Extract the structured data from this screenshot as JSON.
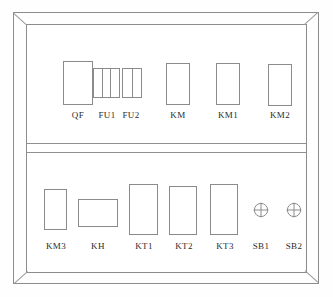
{
  "diagram": {
    "frame": {
      "style": "beveled-cabinet",
      "line_color": "#8b8b8b",
      "background_color": "#ffffff"
    },
    "shelves": [
      {
        "name": "upper-shelf",
        "components": [
          {
            "id": "QF",
            "label": "QF",
            "type": "circuit-breaker",
            "shape": "rectangle",
            "x": 63,
            "y": 61,
            "w": 30,
            "h": 44,
            "label_x": 48,
            "label_y": 110
          },
          {
            "id": "FU1",
            "label": "FU1",
            "type": "fuse-block",
            "shape": "segmented",
            "cells": 3,
            "x": 93,
            "y": 68,
            "w": 27,
            "h": 30,
            "label_x": 77,
            "label_y": 110
          },
          {
            "id": "FU2",
            "label": "FU2",
            "type": "fuse-block",
            "shape": "segmented",
            "cells": 2,
            "x": 122,
            "y": 68,
            "w": 20,
            "h": 30,
            "label_x": 101,
            "label_y": 110
          },
          {
            "id": "KM",
            "label": "KM",
            "type": "contactor",
            "shape": "rectangle",
            "x": 166,
            "y": 63,
            "w": 24,
            "h": 42,
            "label_x": 148,
            "label_y": 110
          },
          {
            "id": "KM1",
            "label": "KM1",
            "type": "contactor",
            "shape": "rectangle",
            "x": 216,
            "y": 63,
            "w": 24,
            "h": 42,
            "label_x": 198,
            "label_y": 110
          },
          {
            "id": "KM2",
            "label": "KM2",
            "type": "contactor",
            "shape": "rectangle",
            "x": 268,
            "y": 64,
            "w": 24,
            "h": 42,
            "label_x": 250,
            "label_y": 110
          }
        ]
      },
      {
        "name": "lower-shelf",
        "components": [
          {
            "id": "KM3",
            "label": "KM3",
            "type": "contactor",
            "shape": "rectangle",
            "x": 44,
            "y": 189,
            "w": 23,
            "h": 41,
            "label_x": 26,
            "label_y": 241
          },
          {
            "id": "KH",
            "label": "KH",
            "type": "thermal-relay",
            "shape": "rectangle",
            "x": 78,
            "y": 199,
            "w": 40,
            "h": 28,
            "label_x": 68,
            "label_y": 241
          },
          {
            "id": "KT1",
            "label": "KT1",
            "type": "time-relay",
            "shape": "rectangle",
            "x": 129,
            "y": 184,
            "w": 29,
            "h": 51,
            "label_x": 114,
            "label_y": 241
          },
          {
            "id": "KT2",
            "label": "KT2",
            "type": "time-relay",
            "shape": "rectangle",
            "x": 169,
            "y": 186,
            "w": 28,
            "h": 49,
            "label_x": 154,
            "label_y": 241
          },
          {
            "id": "KT3",
            "label": "KT3",
            "type": "time-relay",
            "shape": "rectangle",
            "x": 210,
            "y": 184,
            "w": 28,
            "h": 51,
            "label_x": 195,
            "label_y": 241
          },
          {
            "id": "SB1",
            "label": "SB1",
            "type": "pushbutton",
            "shape": "circle-cross",
            "x": 253,
            "y": 202,
            "w": 16,
            "h": 16,
            "label_x": 231,
            "label_y": 241
          },
          {
            "id": "SB2",
            "label": "SB2",
            "type": "pushbutton",
            "shape": "circle-cross",
            "x": 286,
            "y": 202,
            "w": 16,
            "h": 16,
            "label_x": 264,
            "label_y": 241
          }
        ]
      }
    ]
  }
}
